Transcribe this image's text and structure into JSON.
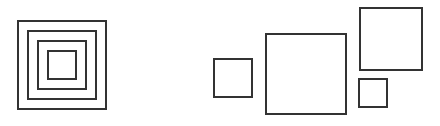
{
  "canvas": {
    "width": 440,
    "height": 126,
    "background_color": "#ffffff"
  },
  "style": {
    "stroke_color": "#333333",
    "stroke_width": 2,
    "fill": "none"
  },
  "chart_data": {
    "type": "diagram",
    "title": "",
    "xlabel": "",
    "ylabel": "",
    "groups": [
      {
        "name": "nested-squares-group",
        "arrangement": "concentric",
        "count": 4,
        "squares": [
          {
            "label": "nested-square-outer",
            "x": 17,
            "y": 20,
            "size": 90
          },
          {
            "label": "nested-square-second",
            "x": 27,
            "y": 30,
            "size": 70
          },
          {
            "label": "nested-square-third",
            "x": 37,
            "y": 40,
            "size": 50
          },
          {
            "label": "nested-square-inner",
            "x": 47,
            "y": 50,
            "size": 30
          }
        ]
      },
      {
        "name": "separate-squares-group",
        "arrangement": "scattered",
        "count": 4,
        "squares": [
          {
            "label": "square-small-left",
            "x": 213,
            "y": 58,
            "size": 40
          },
          {
            "label": "square-large-center",
            "x": 265,
            "y": 33,
            "size": 82
          },
          {
            "label": "square-medium-top-right",
            "x": 359,
            "y": 7,
            "size": 64
          },
          {
            "label": "square-tiny-bottom-right",
            "x": 358,
            "y": 78,
            "size": 30
          }
        ]
      }
    ]
  }
}
